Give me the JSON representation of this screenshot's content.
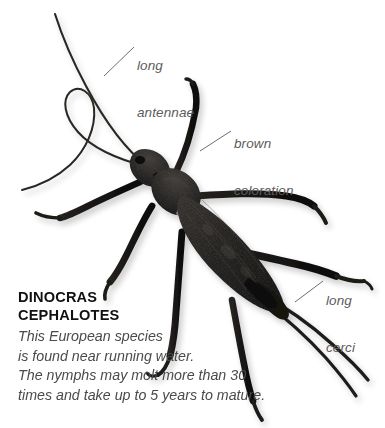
{
  "figure": {
    "background_color": "#ffffff",
    "label_color": "#5c5c5c",
    "title_color": "#111111",
    "body_color": "#4a4a4a",
    "specimen_color": "#1a1a1a"
  },
  "annotations": [
    {
      "id": "antennae",
      "line1": "long",
      "line2": "antennae"
    },
    {
      "id": "coloration",
      "line1": "brown",
      "line2": "coloration"
    },
    {
      "id": "cerci",
      "line1": "long",
      "line2": "cerci"
    }
  ],
  "caption": {
    "genus": "DINOCRAS",
    "species": "CEPHALOTES",
    "lines": [
      "This European species",
      "is found near running water.",
      "The nymphs may molt more than 30",
      "times and take up to 5 years to mature."
    ]
  }
}
